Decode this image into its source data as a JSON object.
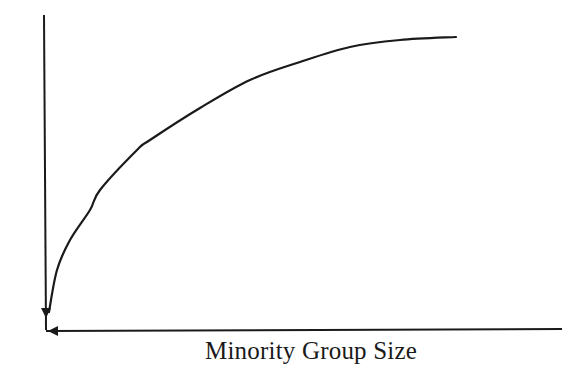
{
  "chart_data": {
    "type": "line",
    "title": "",
    "xlabel": "Minority Group Size",
    "ylabel": "",
    "grid": false,
    "legend": null,
    "axes": {
      "y_axis_arrow": "down",
      "x_axis_arrow": "left",
      "ticks": "none"
    },
    "series": [
      {
        "name": "curve",
        "x": [
          0.01,
          0.024,
          0.049,
          0.088,
          0.107,
          0.179,
          0.204,
          0.301,
          0.398,
          0.496,
          0.593,
          0.69,
          0.799
        ],
        "y": [
          0.06,
          0.19,
          0.29,
          0.39,
          0.45,
          0.58,
          0.61,
          0.71,
          0.8,
          0.86,
          0.9,
          0.93,
          0.94
        ]
      }
    ],
    "pixel_points": [
      [
        49,
        312
      ],
      [
        57,
        270
      ],
      [
        70,
        240
      ],
      [
        90,
        210
      ],
      [
        100,
        190
      ],
      [
        137,
        150
      ],
      [
        150,
        140
      ],
      [
        200,
        108
      ],
      [
        250,
        80
      ],
      [
        300,
        62
      ],
      [
        350,
        47
      ],
      [
        400,
        40
      ],
      [
        456,
        37
      ]
    ],
    "xlim": [
      0,
      1
    ],
    "ylim": [
      0,
      1
    ]
  },
  "labels": {
    "x_axis": "Minority Group Size"
  }
}
